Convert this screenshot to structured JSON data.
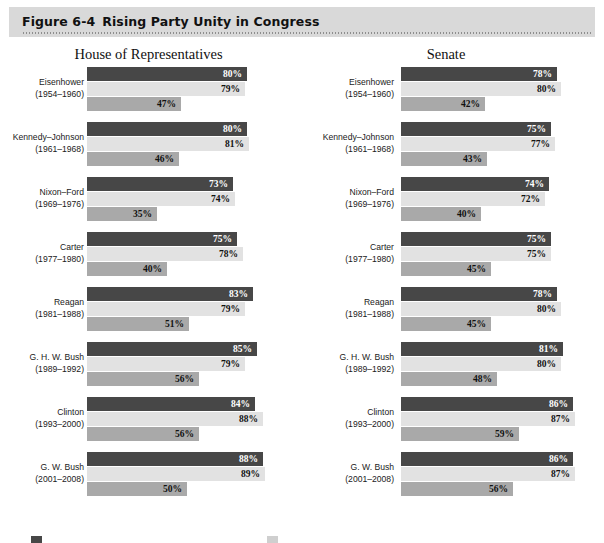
{
  "figure": {
    "number": "Figure 6-4",
    "title": "Rising Party Unity in Congress"
  },
  "colors": {
    "header_band": "#d9d9d9",
    "series_0": "#474747",
    "series_1": "#e2e2e2",
    "series_2": "#a9a9a9",
    "value_label_light": "#ffffff",
    "value_label_dark": "#111111"
  },
  "chart_data": {
    "type": "bar",
    "orientation": "horizontal",
    "title": "Rising Party Unity in Congress",
    "xlabel": "",
    "ylabel": "",
    "xlim": [
      0,
      100
    ],
    "grid": false,
    "legend_position": "bottom",
    "value_suffix": "%",
    "categories": [
      "Eisenhower (1954–1960)",
      "Kennedy–Johnson (1961–1968)",
      "Nixon–Ford (1969–1976)",
      "Carter (1977–1980)",
      "Reagan (1981–1988)",
      "G. H. W. Bush (1989–1992)",
      "Clinton (1993–2000)",
      "G. W. Bush (2001–2008)"
    ],
    "panels": [
      {
        "name": "House of Representatives",
        "series": [
          {
            "name": "series-1",
            "values": [
              80,
              80,
              73,
              75,
              83,
              85,
              84,
              88
            ]
          },
          {
            "name": "series-2",
            "values": [
              79,
              81,
              74,
              78,
              79,
              79,
              88,
              89
            ]
          },
          {
            "name": "series-3",
            "values": [
              47,
              46,
              35,
              40,
              51,
              56,
              56,
              50
            ]
          }
        ]
      },
      {
        "name": "Senate",
        "series": [
          {
            "name": "series-1",
            "values": [
              78,
              75,
              74,
              75,
              78,
              81,
              86,
              86
            ]
          },
          {
            "name": "series-2",
            "values": [
              80,
              77,
              72,
              75,
              80,
              80,
              87,
              87
            ]
          },
          {
            "name": "series-3",
            "values": [
              42,
              43,
              40,
              45,
              45,
              48,
              59,
              56
            ]
          }
        ]
      }
    ]
  },
  "house": {
    "heading": "House of Representatives",
    "groups": [
      {
        "name": "Eisenhower",
        "years": "(1954–1960)",
        "bars": [
          {
            "value": 80,
            "label": "80%"
          },
          {
            "value": 79,
            "label": "79%"
          },
          {
            "value": 47,
            "label": "47%"
          }
        ]
      },
      {
        "name": "Kennedy–Johnson",
        "years": "(1961–1968)",
        "bars": [
          {
            "value": 80,
            "label": "80%"
          },
          {
            "value": 81,
            "label": "81%"
          },
          {
            "value": 46,
            "label": "46%"
          }
        ]
      },
      {
        "name": "Nixon–Ford",
        "years": "(1969–1976)",
        "bars": [
          {
            "value": 73,
            "label": "73%"
          },
          {
            "value": 74,
            "label": "74%"
          },
          {
            "value": 35,
            "label": "35%"
          }
        ]
      },
      {
        "name": "Carter",
        "years": "(1977–1980)",
        "bars": [
          {
            "value": 75,
            "label": "75%"
          },
          {
            "value": 78,
            "label": "78%"
          },
          {
            "value": 40,
            "label": "40%"
          }
        ]
      },
      {
        "name": "Reagan",
        "years": "(1981–1988)",
        "bars": [
          {
            "value": 83,
            "label": "83%"
          },
          {
            "value": 79,
            "label": "79%"
          },
          {
            "value": 51,
            "label": "51%"
          }
        ]
      },
      {
        "name": "G. H. W. Bush",
        "years": "(1989–1992)",
        "bars": [
          {
            "value": 85,
            "label": "85%"
          },
          {
            "value": 79,
            "label": "79%"
          },
          {
            "value": 56,
            "label": "56%"
          }
        ]
      },
      {
        "name": "Clinton",
        "years": "(1993–2000)",
        "bars": [
          {
            "value": 84,
            "label": "84%"
          },
          {
            "value": 88,
            "label": "88%"
          },
          {
            "value": 56,
            "label": "56%"
          }
        ]
      },
      {
        "name": "G. W. Bush",
        "years": "(2001–2008)",
        "bars": [
          {
            "value": 88,
            "label": "88%"
          },
          {
            "value": 89,
            "label": "89%"
          },
          {
            "value": 50,
            "label": "50%"
          }
        ]
      }
    ]
  },
  "senate": {
    "heading": "Senate",
    "groups": [
      {
        "name": "Eisenhower",
        "years": "(1954–1960)",
        "bars": [
          {
            "value": 78,
            "label": "78%"
          },
          {
            "value": 80,
            "label": "80%"
          },
          {
            "value": 42,
            "label": "42%"
          }
        ]
      },
      {
        "name": "Kennedy–Johnson",
        "years": "(1961–1968)",
        "bars": [
          {
            "value": 75,
            "label": "75%"
          },
          {
            "value": 77,
            "label": "77%"
          },
          {
            "value": 43,
            "label": "43%"
          }
        ]
      },
      {
        "name": "Nixon–Ford",
        "years": "(1969–1976)",
        "bars": [
          {
            "value": 74,
            "label": "74%"
          },
          {
            "value": 72,
            "label": "72%"
          },
          {
            "value": 40,
            "label": "40%"
          }
        ]
      },
      {
        "name": "Carter",
        "years": "(1977–1980)",
        "bars": [
          {
            "value": 75,
            "label": "75%"
          },
          {
            "value": 75,
            "label": "75%"
          },
          {
            "value": 45,
            "label": "45%"
          }
        ]
      },
      {
        "name": "Reagan",
        "years": "(1981–1988)",
        "bars": [
          {
            "value": 78,
            "label": "78%"
          },
          {
            "value": 80,
            "label": "80%"
          },
          {
            "value": 45,
            "label": "45%"
          }
        ]
      },
      {
        "name": "G. H. W. Bush",
        "years": "(1989–1992)",
        "bars": [
          {
            "value": 81,
            "label": "81%"
          },
          {
            "value": 80,
            "label": "80%"
          },
          {
            "value": 48,
            "label": "48%"
          }
        ]
      },
      {
        "name": "Clinton",
        "years": "(1993–2000)",
        "bars": [
          {
            "value": 86,
            "label": "86%"
          },
          {
            "value": 87,
            "label": "87%"
          },
          {
            "value": 59,
            "label": "59%"
          }
        ]
      },
      {
        "name": "G. W. Bush",
        "years": "(2001–2008)",
        "bars": [
          {
            "value": 86,
            "label": "86%"
          },
          {
            "value": 87,
            "label": "87%"
          },
          {
            "value": 56,
            "label": "56%"
          }
        ]
      }
    ]
  }
}
